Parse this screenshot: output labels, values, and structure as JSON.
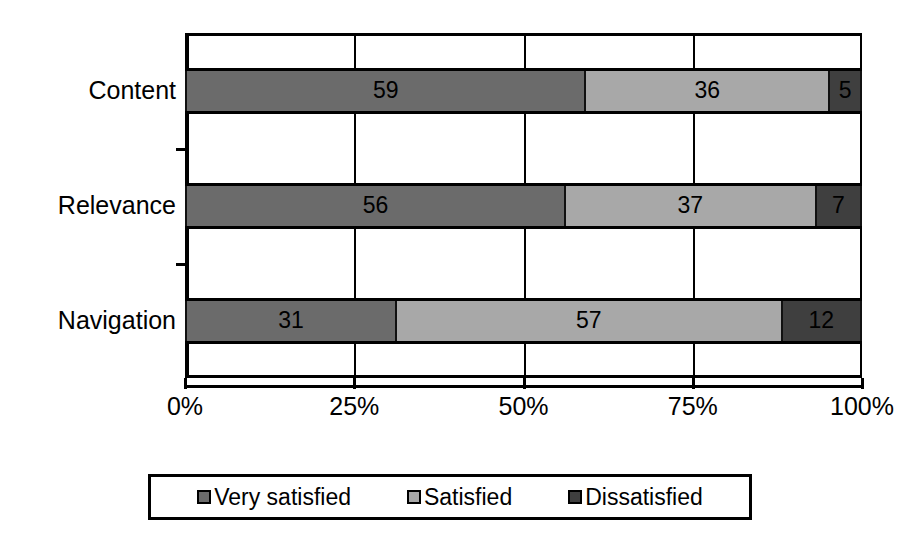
{
  "chart_data": {
    "type": "bar",
    "orientation": "horizontal",
    "stacked": true,
    "normalized": true,
    "title": "",
    "xlabel": "",
    "ylabel": "",
    "categories": [
      "Content",
      "Relevance",
      "Navigation"
    ],
    "series": [
      {
        "name": "Very satisfied",
        "color": "#6b6b6b",
        "values": [
          59,
          36.5,
          31
        ]
      },
      {
        "name": "Satisfied",
        "color": "#a8a8a8",
        "values": [
          36,
          36.5,
          57
        ]
      },
      {
        "name": "Dissatisfied",
        "color": "#3f3f3f",
        "values": [
          5,
          7,
          12
        ]
      }
    ],
    "bars": [
      {
        "category": "Content",
        "segments": [
          {
            "series": "Very satisfied",
            "value": 59,
            "label": "59",
            "color": "#6b6b6b"
          },
          {
            "series": "Satisfied",
            "value": 36,
            "label": "36",
            "color": "#a8a8a8"
          },
          {
            "series": "Dissatisfied",
            "value": 5,
            "label": "5",
            "color": "#3f3f3f"
          }
        ]
      },
      {
        "category": "Relevance",
        "segments": [
          {
            "series": "Very satisfied",
            "value": 56,
            "label": "56",
            "color": "#6b6b6b"
          },
          {
            "series": "Satisfied",
            "value": 37,
            "label": "37",
            "color": "#a8a8a8"
          },
          {
            "series": "Dissatisfied",
            "value": 7,
            "label": "7",
            "color": "#3f3f3f"
          }
        ]
      },
      {
        "category": "Navigation",
        "segments": [
          {
            "series": "Very satisfied",
            "value": 31,
            "label": "31",
            "color": "#6b6b6b"
          },
          {
            "series": "Satisfied",
            "value": 57,
            "label": "57",
            "color": "#a8a8a8"
          },
          {
            "series": "Dissatisfied",
            "value": 12,
            "label": "12",
            "color": "#3f3f3f"
          }
        ]
      }
    ],
    "xlim": [
      0,
      100
    ],
    "xticks": [
      0,
      25,
      50,
      75,
      100
    ],
    "xticklabels": [
      "0%",
      "25%",
      "50%",
      "75%",
      "100%"
    ],
    "grid": true,
    "legend_position": "bottom",
    "legend": [
      "Very satisfied",
      "Satisfied",
      "Dissatisfied"
    ]
  }
}
